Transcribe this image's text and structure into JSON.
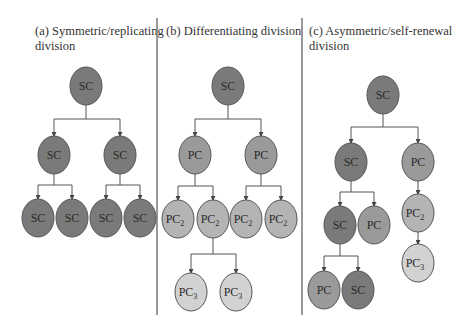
{
  "colors": {
    "sc": "#7a7a7a",
    "pc": "#9a9a9a",
    "pc2": "#b4b4b4",
    "pc3": "#d2d2d2",
    "stroke": "#555555",
    "divider": "#777777"
  },
  "panels": [
    {
      "id": "a",
      "title_line1": "(a) Symmetric/replicating",
      "title_line2": "division",
      "nodes": [
        {
          "label": "SC",
          "sub": "",
          "type": "sc",
          "cx": 86,
          "cy": 86
        },
        {
          "label": "SC",
          "sub": "",
          "type": "sc",
          "cx": 54,
          "cy": 155
        },
        {
          "label": "SC",
          "sub": "",
          "type": "sc",
          "cx": 120,
          "cy": 155
        },
        {
          "label": "SC",
          "sub": "",
          "type": "sc",
          "cx": 38,
          "cy": 218
        },
        {
          "label": "SC",
          "sub": "",
          "type": "sc",
          "cx": 72,
          "cy": 218
        },
        {
          "label": "SC",
          "sub": "",
          "type": "sc",
          "cx": 106,
          "cy": 218
        },
        {
          "label": "SC",
          "sub": "",
          "type": "sc",
          "cx": 140,
          "cy": 218
        }
      ]
    },
    {
      "id": "b",
      "title_line1": "(b) Differentiating division",
      "title_line2": "",
      "nodes": [
        {
          "label": "SC",
          "sub": "",
          "type": "sc",
          "cx": 228,
          "cy": 86
        },
        {
          "label": "PC",
          "sub": "",
          "type": "pc",
          "cx": 195,
          "cy": 155
        },
        {
          "label": "PC",
          "sub": "",
          "type": "pc",
          "cx": 261,
          "cy": 155
        },
        {
          "label": "PC",
          "sub": "2",
          "type": "pc2",
          "cx": 178,
          "cy": 219
        },
        {
          "label": "PC",
          "sub": "2",
          "type": "pc2",
          "cx": 213,
          "cy": 219
        },
        {
          "label": "PC",
          "sub": "2",
          "type": "pc2",
          "cx": 246,
          "cy": 219
        },
        {
          "label": "PC",
          "sub": "2",
          "type": "pc2",
          "cx": 281,
          "cy": 219
        },
        {
          "label": "PC",
          "sub": "3",
          "type": "pc3",
          "cx": 191,
          "cy": 292
        },
        {
          "label": "PC",
          "sub": "3",
          "type": "pc3",
          "cx": 236,
          "cy": 292
        }
      ]
    },
    {
      "id": "c",
      "title_line1": "(c) Asymmetric/self-renewal",
      "title_line2": "division",
      "nodes": [
        {
          "label": "SC",
          "sub": "",
          "type": "sc",
          "cx": 383,
          "cy": 95
        },
        {
          "label": "SC",
          "sub": "",
          "type": "sc",
          "cx": 351,
          "cy": 162
        },
        {
          "label": "PC",
          "sub": "",
          "type": "pc",
          "cx": 418,
          "cy": 162
        },
        {
          "label": "SC",
          "sub": "",
          "type": "sc",
          "cx": 340,
          "cy": 225
        },
        {
          "label": "PC",
          "sub": "",
          "type": "pc",
          "cx": 374,
          "cy": 225
        },
        {
          "label": "PC",
          "sub": "2",
          "type": "pc2",
          "cx": 418,
          "cy": 213
        },
        {
          "label": "PC",
          "sub": "3",
          "type": "pc3",
          "cx": 418,
          "cy": 263
        },
        {
          "label": "PC",
          "sub": "",
          "type": "pc",
          "cx": 324,
          "cy": 290
        },
        {
          "label": "SC",
          "sub": "",
          "type": "sc",
          "cx": 358,
          "cy": 290
        }
      ]
    }
  ]
}
